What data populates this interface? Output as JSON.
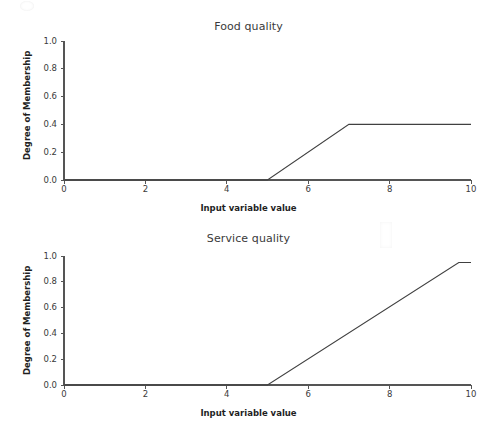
{
  "figure": {
    "width": 497,
    "height": 437,
    "background": "#ffffff",
    "line_color": "#404040",
    "axis_color": "#555555",
    "text_color": "#3a3a3a"
  },
  "chart_data": [
    {
      "type": "line",
      "title": "Food quality",
      "xlabel": "Input variable value",
      "ylabel": "Degree of Membership",
      "xlim": [
        0,
        10
      ],
      "ylim": [
        0.0,
        1.0
      ],
      "xticks": [
        0,
        2,
        4,
        6,
        8,
        10
      ],
      "xticklabels": [
        "0",
        "2",
        "4",
        "6",
        "8",
        "10"
      ],
      "yticks": [
        0.0,
        0.2,
        0.4,
        0.6,
        0.8,
        1.0
      ],
      "yticklabels": [
        "0.0",
        "0.2",
        "0.4",
        "0.6",
        "0.8",
        "1.0"
      ],
      "grid": false,
      "legend": null,
      "series": [
        {
          "name": "food-membership",
          "color": "#404040",
          "x": [
            0,
            5,
            7,
            10
          ],
          "y": [
            0.0,
            0.0,
            0.4,
            0.4
          ]
        }
      ],
      "annotations": {
        "plateau_value": 0.4,
        "ramp_start_x": 5,
        "ramp_end_x": 7
      }
    },
    {
      "type": "line",
      "title": "Service quality",
      "xlabel": "Input variable value",
      "ylabel": "Degree of Membership",
      "xlim": [
        0,
        10
      ],
      "ylim": [
        0.0,
        1.0
      ],
      "xticks": [
        0,
        2,
        4,
        6,
        8,
        10
      ],
      "xticklabels": [
        "0",
        "2",
        "4",
        "6",
        "8",
        "10"
      ],
      "yticks": [
        0.0,
        0.2,
        0.4,
        0.6,
        0.8,
        1.0
      ],
      "yticklabels": [
        "0.0",
        "0.2",
        "0.4",
        "0.6",
        "0.8",
        "1.0"
      ],
      "grid": false,
      "legend": null,
      "series": [
        {
          "name": "service-membership",
          "color": "#404040",
          "x": [
            0,
            5,
            9.7,
            10
          ],
          "y": [
            0.0,
            0.0,
            0.95,
            0.95
          ]
        }
      ],
      "annotations": {
        "plateau_value": 0.95,
        "ramp_start_x": 5,
        "ramp_end_x": 9.7
      }
    }
  ],
  "panels": {
    "food": {
      "title": "Food quality",
      "xlabel": "Input variable value",
      "ylabel": "Degree of Membership"
    },
    "service": {
      "title": "Service quality",
      "xlabel": "Input variable value",
      "ylabel": "Degree of Membership"
    }
  }
}
